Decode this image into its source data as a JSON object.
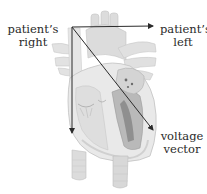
{
  "figure": {
    "labels": {
      "patient_right": {
        "line1": "patient’s",
        "line2": "right"
      },
      "patient_left": {
        "line1": "patient’s",
        "line2": "left"
      },
      "voltage_vector": {
        "line1": "voltage",
        "line2": "vector"
      }
    },
    "axes": {
      "origin": [
        72,
        27
      ],
      "horizontal_arrow_end": [
        154,
        26
      ],
      "vertical_arrow_end": [
        72,
        134
      ],
      "voltage_vector_end": [
        154,
        131
      ]
    },
    "colors": {
      "arrow": "#2b2b2b",
      "heart_light": "#e4e4e4",
      "heart_mid": "#cfcfcf",
      "heart_dark": "#8a8a8a",
      "text": "#2a2a2a"
    }
  }
}
